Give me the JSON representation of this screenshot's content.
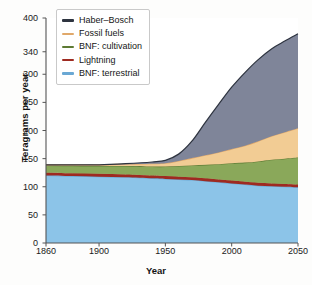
{
  "chart_data": {
    "type": "area",
    "stacked": true,
    "title": "",
    "xlabel": "Year",
    "ylabel": "Teragrams per year",
    "xlim": [
      1860,
      2050
    ],
    "ylim": [
      0,
      400
    ],
    "xticks": [
      1860,
      1900,
      1950,
      2000,
      2050
    ],
    "yticks": [
      0,
      50,
      100,
      150,
      200,
      250,
      300,
      340,
      400
    ],
    "grid": false,
    "legend_position": "top-left",
    "x": [
      1860,
      1880,
      1900,
      1920,
      1940,
      1950,
      1960,
      1970,
      1980,
      1990,
      2000,
      2010,
      2020,
      2030,
      2040,
      2050
    ],
    "series": [
      {
        "name": "BNF: terrestrial",
        "color": "#8cc4e8",
        "line_color": "#6aa8d4",
        "values": [
          120,
          119,
          118,
          117,
          115,
          114,
          113,
          112,
          110,
          108,
          106,
          104,
          102,
          101,
          100,
          99
        ]
      },
      {
        "name": "Lightning",
        "color": "#9e2a21",
        "line_color": "#9e2a21",
        "values": [
          5,
          5,
          5,
          5,
          5,
          5,
          5,
          5,
          5,
          5,
          5,
          5,
          5,
          5,
          5,
          5
        ]
      },
      {
        "name": "BNF: cultivation",
        "color": "#8aa85a",
        "line_color": "#5d7a33",
        "values": [
          13,
          13.5,
          14,
          15,
          16,
          17,
          19,
          21,
          24,
          27,
          31,
          34,
          38,
          42,
          45,
          48
        ]
      },
      {
        "name": "Fossil fuels",
        "color": "#f2cc94",
        "line_color": "#e0a86a",
        "values": [
          1,
          1.5,
          2,
          3,
          5,
          6,
          9,
          13,
          17,
          21,
          25,
          30,
          36,
          42,
          47,
          52
        ]
      },
      {
        "name": "Haber–Bosch",
        "color": "#7f8599",
        "line_color": "#2e3440",
        "values": [
          0,
          0,
          0,
          1,
          3,
          5,
          12,
          30,
          58,
          85,
          110,
          130,
          145,
          155,
          162,
          168
        ]
      }
    ],
    "legend_order": [
      "Haber–Bosch",
      "Fossil fuels",
      "BNF: cultivation",
      "Lightning",
      "BNF: terrestrial"
    ],
    "axis_color": "#555555",
    "plot_background": "#ffffff"
  }
}
